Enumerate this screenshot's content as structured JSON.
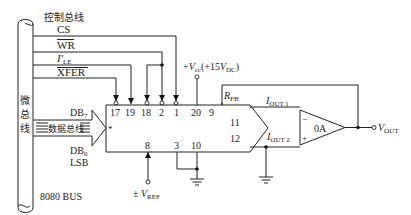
{
  "diagram": {
    "bus": {
      "vertical_label": [
        "微",
        "总",
        "线"
      ],
      "name": "8080 BUS",
      "control_bus_label": "控制总线",
      "data_bus_label": "数据总线",
      "msb_label": "DB",
      "msb_sub": "7",
      "lsb_label": "DB",
      "lsb_sub": "0",
      "lsb_text": "LSB"
    },
    "control_signals": [
      {
        "name": "CS",
        "overline": false,
        "pin": "1"
      },
      {
        "name": "WR",
        "overline": true,
        "pin": "2,18"
      },
      {
        "name": "I'",
        "sub": "LE",
        "overline": false,
        "pin": "19"
      },
      {
        "name": "XFER",
        "overline": true,
        "pin": "17"
      }
    ],
    "chip_top_pins": [
      "17",
      "19",
      "18",
      "2",
      "1",
      "20",
      "9"
    ],
    "chip_right_pins": [
      "11",
      "12"
    ],
    "chip_bottom_pins": [
      "8",
      "3",
      "10"
    ],
    "labels": {
      "vcc": "+V",
      "vcc_sub": "cc",
      "vcc_value": "(+15V",
      "vcc_value_sub": "DC",
      "vcc_close": ")",
      "rfb": "R",
      "rfb_sub": "FB",
      "iout1": "I",
      "iout1_sub": "OUT 1",
      "iout2": "I",
      "iout2_sub": "OUT 2",
      "vref_prefix": "± V",
      "vref_sub": "REF",
      "opamp": "0A",
      "opamp_minus": "−",
      "opamp_plus": "+",
      "vout": "V",
      "vout_sub": "OUT",
      "star": "*"
    }
  }
}
